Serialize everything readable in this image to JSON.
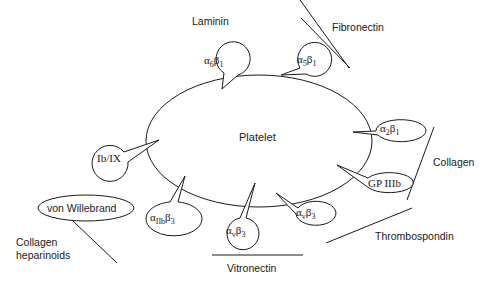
{
  "diagram": {
    "center_label": "Platelet",
    "ligands": {
      "laminin": "Laminin",
      "fibronectin": "Fibronectin",
      "collagen": "Collagen",
      "thrombospondin": "Thrombospondin",
      "vitronectin": "Vitronectin",
      "collagen_heparinoids_line1": "Collagen",
      "collagen_heparinoids_line2": "heparinoids",
      "von_willebrand": "von Willebrand"
    },
    "receptors": {
      "a6b1": {
        "alpha": "α",
        "alpha_sub": "6",
        "beta": "β",
        "beta_sub": "1"
      },
      "a5b1": {
        "alpha": "α",
        "alpha_sub": "5",
        "beta": "β",
        "beta_sub": "1"
      },
      "a2b1": {
        "alpha": "α",
        "alpha_sub": "2",
        "beta": "β",
        "beta_sub": "1"
      },
      "gp3b": {
        "label": "GP IIIb"
      },
      "avb3_right": {
        "alpha": "α",
        "alpha_sub": "v",
        "beta": "β",
        "beta_sub": "3"
      },
      "avb3": {
        "alpha": "α",
        "alpha_sub": "v",
        "beta": "β",
        "beta_sub": "3"
      },
      "a2bb3": {
        "alpha": "α",
        "alpha_sub": "IIb",
        "beta": "β",
        "beta_sub": "3"
      },
      "gp1b9": {
        "label": "Ib/IX"
      }
    }
  }
}
